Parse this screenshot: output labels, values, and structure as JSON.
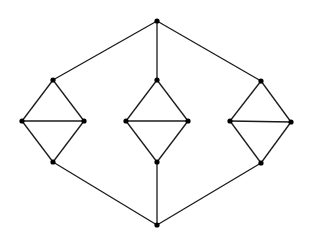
{
  "graph": {
    "edge_color": "#1a1a1a",
    "node_color": "#000000",
    "nodes": [
      {
        "id": "top",
        "x": 157,
        "y": 21
      },
      {
        "id": "bottom",
        "x": 157,
        "y": 225
      },
      {
        "id": "L_top",
        "x": 53,
        "y": 80
      },
      {
        "id": "L_left",
        "x": 22,
        "y": 121
      },
      {
        "id": "L_right",
        "x": 84,
        "y": 121
      },
      {
        "id": "L_bottom",
        "x": 53,
        "y": 162
      },
      {
        "id": "M_top",
        "x": 157,
        "y": 80
      },
      {
        "id": "M_left",
        "x": 126,
        "y": 121
      },
      {
        "id": "M_right",
        "x": 188,
        "y": 121
      },
      {
        "id": "M_bottom",
        "x": 157,
        "y": 162
      },
      {
        "id": "R_top",
        "x": 261,
        "y": 81
      },
      {
        "id": "R_left",
        "x": 230,
        "y": 121
      },
      {
        "id": "R_right",
        "x": 291,
        "y": 122
      },
      {
        "id": "R_bottom",
        "x": 261,
        "y": 163
      }
    ],
    "edges": [
      [
        "top",
        "L_top"
      ],
      [
        "top",
        "M_top"
      ],
      [
        "top",
        "R_top"
      ],
      [
        "bottom",
        "L_bottom"
      ],
      [
        "bottom",
        "M_bottom"
      ],
      [
        "bottom",
        "R_bottom"
      ],
      [
        "L_top",
        "L_left"
      ],
      [
        "L_top",
        "L_right"
      ],
      [
        "L_left",
        "L_right"
      ],
      [
        "L_left",
        "L_bottom"
      ],
      [
        "L_right",
        "L_bottom"
      ],
      [
        "M_top",
        "M_left"
      ],
      [
        "M_top",
        "M_right"
      ],
      [
        "M_left",
        "M_right"
      ],
      [
        "M_left",
        "M_bottom"
      ],
      [
        "M_right",
        "M_bottom"
      ],
      [
        "R_top",
        "R_left"
      ],
      [
        "R_top",
        "R_right"
      ],
      [
        "R_left",
        "R_right"
      ],
      [
        "R_left",
        "R_bottom"
      ],
      [
        "R_right",
        "R_bottom"
      ]
    ]
  }
}
